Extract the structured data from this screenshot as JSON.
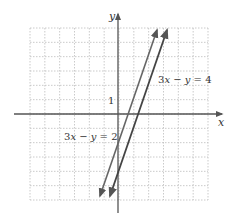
{
  "chart_data": {
    "type": "line",
    "title": "",
    "xlabel": "x",
    "ylabel": "y",
    "xlim": [
      -6,
      6
    ],
    "ylim": [
      -6,
      6
    ],
    "grid": true,
    "tick_labels": [
      {
        "axis": "y",
        "value": 1,
        "label": "1"
      }
    ],
    "series": [
      {
        "name": "3x − y = 2",
        "equation": "y = 3x - 2",
        "slope": 3,
        "intercept": -2,
        "x": [
          -1,
          2.6
        ],
        "y": [
          -5,
          5.8
        ]
      },
      {
        "name": "3x − y = 4",
        "equation": "y = 3x - 4",
        "slope": 3,
        "intercept": -4,
        "x": [
          -0.3,
          3.3
        ],
        "y": [
          -5,
          5.8
        ]
      }
    ],
    "annotations": [
      {
        "text": "3x − y = 4",
        "near": "line 2, upper right"
      },
      {
        "text": "3x − y = 2",
        "near": "line 1, lower left"
      }
    ],
    "legend": "none"
  },
  "labels": {
    "x_axis": "x",
    "y_axis": "y",
    "tick_one": "1",
    "eq1_a": "3",
    "eq1_b": "x",
    "eq1_c": " − ",
    "eq1_d": "y",
    "eq1_e": " = 2",
    "eq2_a": "3",
    "eq2_b": "x",
    "eq2_c": " − ",
    "eq2_d": "y",
    "eq2_e": " = 4"
  },
  "colors": {
    "grid": "#bbbbbb",
    "axis": "#555555",
    "line": "#555555"
  }
}
